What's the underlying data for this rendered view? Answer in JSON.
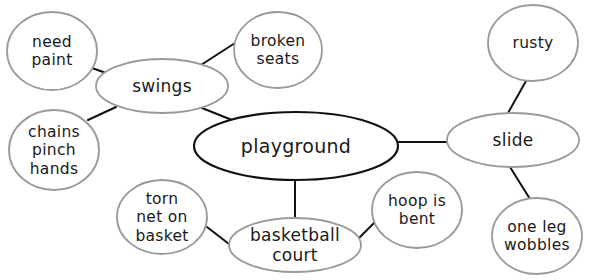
{
  "diagram": {
    "type": "idea-web",
    "center": {
      "id": "playground",
      "lines": [
        "playground"
      ],
      "cx": 296,
      "cy": 146,
      "rx": 102,
      "ry": 34
    },
    "subtopics": [
      {
        "id": "swings",
        "lines": [
          "swings"
        ],
        "cx": 162,
        "cy": 86,
        "rx": 66,
        "ry": 27
      },
      {
        "id": "slide",
        "lines": [
          "slide"
        ],
        "cx": 513,
        "cy": 140,
        "rx": 66,
        "ry": 27
      },
      {
        "id": "basketball-court",
        "lines": [
          "basketball",
          "court"
        ],
        "cx": 295,
        "cy": 245,
        "rx": 66,
        "ry": 27
      }
    ],
    "details": [
      {
        "id": "need-paint",
        "parent": "swings",
        "lines": [
          "need",
          "paint"
        ],
        "cx": 52,
        "cy": 51,
        "rx": 45,
        "ry": 39
      },
      {
        "id": "broken-seats",
        "parent": "swings",
        "lines": [
          "broken",
          "seats"
        ],
        "cx": 278,
        "cy": 50,
        "rx": 44,
        "ry": 38
      },
      {
        "id": "chains-pinch-hands",
        "parent": "swings",
        "lines": [
          "chains",
          "pinch",
          "hands"
        ],
        "cx": 54,
        "cy": 150,
        "rx": 45,
        "ry": 40
      },
      {
        "id": "rusty",
        "parent": "slide",
        "lines": [
          "rusty"
        ],
        "cx": 533,
        "cy": 43,
        "rx": 45,
        "ry": 38
      },
      {
        "id": "one-leg-wobbles",
        "parent": "slide",
        "lines": [
          "one leg",
          "wobbles"
        ],
        "cx": 537,
        "cy": 236,
        "rx": 45,
        "ry": 38
      },
      {
        "id": "torn-net-on-basket",
        "parent": "basketball-court",
        "lines": [
          "torn",
          "net on",
          "basket"
        ],
        "cx": 162,
        "cy": 217,
        "rx": 45,
        "ry": 37
      },
      {
        "id": "hoop-is-bent",
        "parent": "basketball-court",
        "lines": [
          "hoop is",
          "bent"
        ],
        "cx": 417,
        "cy": 210,
        "rx": 45,
        "ry": 38
      }
    ],
    "connectors": [
      {
        "from": "need-paint",
        "to": "swings",
        "x1": 92,
        "y1": 68,
        "x2": 106,
        "y2": 73
      },
      {
        "from": "swings",
        "to": "broken-seats",
        "x1": 201,
        "y1": 65,
        "x2": 235,
        "y2": 43
      },
      {
        "from": "chains-pinch-hands",
        "to": "swings",
        "x1": 88,
        "y1": 120,
        "x2": 116,
        "y2": 107
      },
      {
        "from": "swings",
        "to": "playground",
        "x1": 202,
        "y1": 108,
        "x2": 232,
        "y2": 120
      },
      {
        "from": "playground",
        "to": "slide",
        "x1": 398,
        "y1": 142,
        "x2": 448,
        "y2": 142
      },
      {
        "from": "rusty",
        "to": "slide",
        "x1": 526,
        "y1": 81,
        "x2": 508,
        "y2": 113
      },
      {
        "from": "slide",
        "to": "one-leg-wobbles",
        "x1": 510,
        "y1": 167,
        "x2": 530,
        "y2": 199
      },
      {
        "from": "playground",
        "to": "basketball-court",
        "x1": 295,
        "y1": 180,
        "x2": 295,
        "y2": 218
      },
      {
        "from": "torn-net-on-basket",
        "to": "basketball-court",
        "x1": 207,
        "y1": 227,
        "x2": 229,
        "y2": 244
      },
      {
        "from": "basketball-court",
        "to": "hoop-is-bent",
        "x1": 359,
        "y1": 238,
        "x2": 375,
        "y2": 222
      }
    ],
    "colors": {
      "background": "#ffffff",
      "center_stroke": "#111111",
      "node_stroke": "#9a9a9a",
      "connector": "#111111",
      "text": "#1a1a1a"
    }
  }
}
